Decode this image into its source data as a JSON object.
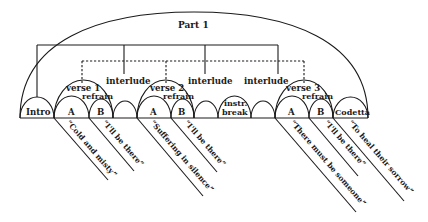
{
  "title": "Part 1",
  "sections": [
    {
      "id": "intro",
      "label": "Intro"
    },
    {
      "id": "v1a",
      "label": "A"
    },
    {
      "id": "v1b",
      "label": "B"
    },
    {
      "id": "int1",
      "label": ""
    },
    {
      "id": "v2a",
      "label": "A"
    },
    {
      "id": "v2b",
      "label": "B"
    },
    {
      "id": "int2",
      "label": ""
    },
    {
      "id": "instr",
      "label_line1": "instr.",
      "label_line2": "break"
    },
    {
      "id": "int3",
      "label": ""
    },
    {
      "id": "v3a",
      "label": "A"
    },
    {
      "id": "v3b",
      "label": "B"
    },
    {
      "id": "codetta",
      "label": "Codetta"
    }
  ],
  "verses": [
    {
      "label": "verse 1",
      "refrain": "refrain"
    },
    {
      "label": "verse 2",
      "refrain": "refrain"
    },
    {
      "label": "verse 3",
      "refrain": "refrain"
    }
  ],
  "interludes": [
    "interlude",
    "interlude",
    "interlude"
  ],
  "lyrics": [
    "“Cold and misty”",
    "“I'll be there”",
    "“Suffering in silence”",
    "“I'll be there”",
    "“There must be someone”",
    "“I'll be there”",
    "“To heal their sorrow”"
  ]
}
